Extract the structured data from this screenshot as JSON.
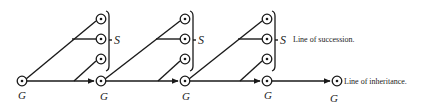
{
  "diagram": {
    "labels": {
      "generation": "G",
      "succession": "S",
      "line_of_succession": "Line of succession.",
      "line_of_inheritance": "Line of inheritance."
    },
    "colors": {
      "ink": "#1a1a1a",
      "background": "#ffffff"
    },
    "units": [
      {
        "origin_x": 22,
        "column_x": 101
      },
      {
        "origin_x": 101,
        "column_x": 185
      },
      {
        "origin_x": 185,
        "column_x": 267
      }
    ],
    "final_node": {
      "x": 337
    },
    "g_label_positions": [
      22,
      104,
      186,
      268,
      334
    ]
  }
}
